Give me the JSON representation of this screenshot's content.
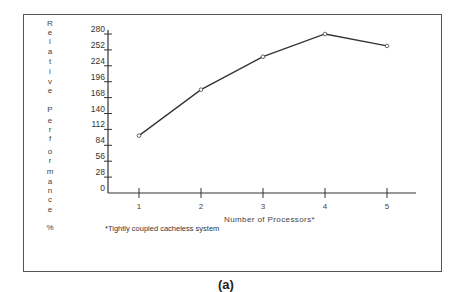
{
  "chart_data": {
    "type": "line",
    "title": "",
    "caption": "(a)",
    "xlabel": "Number of Processors*",
    "ylabel": "Relative Performance %",
    "x": [
      1,
      2,
      3,
      4,
      5
    ],
    "series": [
      {
        "name": "Relative Performance",
        "values": [
          101,
          182,
          240,
          280,
          259
        ]
      }
    ],
    "xticks": [
      "1",
      "2",
      "3",
      "4",
      "5"
    ],
    "yticks": [
      "0",
      "28",
      "56",
      "84",
      "112",
      "140",
      "168",
      "196",
      "224",
      "252",
      "280"
    ],
    "ylim": [
      0,
      280
    ],
    "xlim": [
      0.5,
      5.5
    ],
    "grid": false,
    "legend": null,
    "annotations": [
      "*Tightly coupled cacheless system"
    ],
    "marker": "open-circle"
  },
  "ylabel_chars": [
    "R",
    "e",
    "l",
    "a",
    "t",
    "i",
    "v",
    "e",
    "",
    "P",
    "e",
    "r",
    "f",
    "o",
    "r",
    "m",
    "a",
    "n",
    "c",
    "e",
    "",
    "%"
  ]
}
